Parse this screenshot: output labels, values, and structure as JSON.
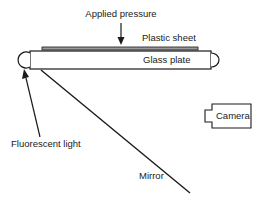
{
  "diagram": {
    "labels": {
      "applied_pressure": "Applied pressure",
      "plastic_sheet": "Plastic sheet",
      "glass_plate": "Glass plate",
      "fluorescent_light": "Fluorescent light",
      "camera": "Camera",
      "mirror": "Mirror"
    },
    "colors": {
      "stroke": "#1a1a1a",
      "sheet_fill": "#9a9a9a",
      "background": "#ffffff"
    }
  }
}
